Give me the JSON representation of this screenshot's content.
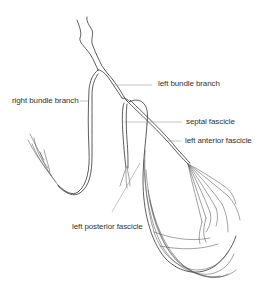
{
  "diagram": {
    "labels": {
      "left_bundle_branch": "left bundle branch",
      "right_bundle_branch": "right bundle branch",
      "septal_fascicle": "septal fascicle",
      "left_anterior_fascicle": "left anterior fascicle",
      "left_posterior_fascicle": "left posterior fascicle"
    },
    "colors": {
      "line": "#333333",
      "label_text": "#333333",
      "leader_line": "#888888",
      "background": "#ffffff"
    }
  }
}
